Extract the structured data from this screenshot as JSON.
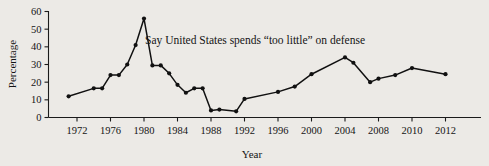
{
  "chart_data": {
    "type": "line",
    "title": "",
    "xlabel": "Year",
    "ylabel": "Percentage",
    "annotation": "Say United States spends “too little” on defense",
    "grid": false,
    "legend": "none",
    "xlim": [
      1971,
      2012
    ],
    "ylim": [
      0,
      60
    ],
    "yticks": [
      0,
      10,
      20,
      30,
      40,
      50,
      60
    ],
    "ytick_labels": [
      "0",
      "10",
      "20",
      "30",
      "40",
      "50",
      "60"
    ],
    "xticks": [
      1972,
      1976,
      1980,
      1984,
      1988,
      1992,
      1996,
      2000,
      2004,
      2008,
      2010,
      2012
    ],
    "xtick_labels": [
      "1972",
      "1976",
      "1980",
      "1984",
      "1988",
      "1992",
      "1996",
      "2000",
      "2004",
      "2008",
      "2010",
      "2012"
    ],
    "x_axis_note": "non-linear spacing: equal steps through 2008, then 2010 and 2012",
    "x": [
      1971,
      1974,
      1975,
      1976,
      1977,
      1978,
      1979,
      1980,
      1981,
      1982,
      1983,
      1984,
      1985,
      1986,
      1987,
      1988,
      1989,
      1991,
      1992,
      1996,
      1998,
      2000,
      2004,
      2005,
      2007,
      2008,
      2009,
      2010,
      2012
    ],
    "values": [
      12,
      16.5,
      16.5,
      24,
      24,
      30,
      41,
      56,
      29.5,
      29.5,
      25,
      18.5,
      14,
      16.5,
      16.5,
      4,
      4.5,
      3.5,
      10.5,
      14.5,
      17.5,
      24.5,
      34,
      31,
      20,
      22,
      24,
      28,
      24.5
    ],
    "series": [
      {
        "name": "Say United States spends “too little” on defense",
        "values": [
          12,
          16.5,
          16.5,
          24,
          24,
          30,
          41,
          56,
          29.5,
          29.5,
          25,
          18.5,
          14,
          16.5,
          16.5,
          4,
          4.5,
          3.5,
          10.5,
          14.5,
          17.5,
          24.5,
          34,
          31,
          20,
          22,
          24,
          28,
          24.5
        ]
      }
    ]
  },
  "figure": {
    "background_color": "#eceae6",
    "line_color": "#111111",
    "axis_color": "#1b1b1b",
    "text_color": "#141414"
  }
}
